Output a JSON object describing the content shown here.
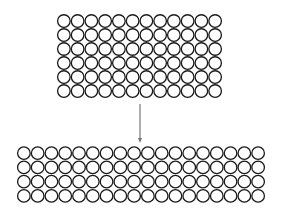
{
  "diagram": {
    "colors": {
      "circle_stroke": "#1a1a1a",
      "arrow": "#777777",
      "background": "#ffffff"
    },
    "top_grid": {
      "columns": 12,
      "rows": 6,
      "x": 57,
      "y": 14,
      "width": 165,
      "height": 84,
      "total": 72
    },
    "arrow": {
      "x": 140,
      "y1": 104,
      "y2": 143,
      "direction": "down"
    },
    "bottom_grid": {
      "columns": 18,
      "rows": 4,
      "x": 17,
      "y": 146,
      "width": 248,
      "height": 57,
      "total": 72
    }
  }
}
